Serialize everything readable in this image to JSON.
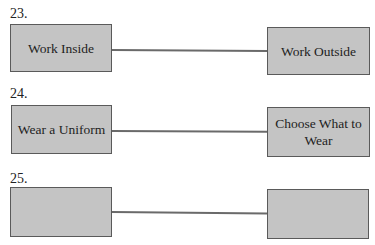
{
  "items": [
    {
      "number": "23.",
      "left": "Work Inside",
      "right": "Work Outside"
    },
    {
      "number": "24.",
      "left": "Wear a Uniform",
      "right": "Choose What to Wear"
    },
    {
      "number": "25.",
      "left": "",
      "right": ""
    }
  ],
  "colors": {
    "box_fill": "#c4c4c4",
    "box_border": "#5a5a5a",
    "line": "#6a6a6a"
  }
}
